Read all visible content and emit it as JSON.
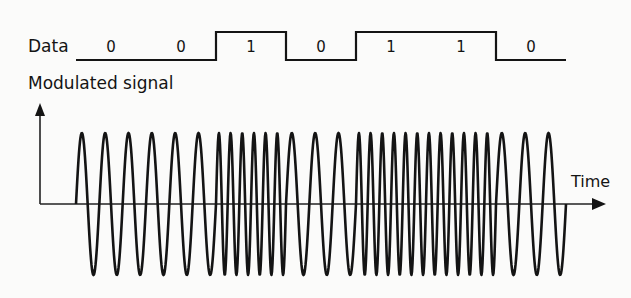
{
  "labels": {
    "data": "Data",
    "signal": "Modulated signal",
    "time": "Time"
  },
  "data_bits": [
    "0",
    "0",
    "1",
    "0",
    "1",
    "1",
    "0"
  ],
  "colors": {
    "ink": "#141414",
    "background": "#fbfbfa"
  },
  "chart_data": {
    "type": "line",
    "xlabel": "Time",
    "ylabel": "Modulated signal",
    "series": [
      {
        "name": "Data",
        "kind": "square",
        "bits": [
          0,
          0,
          1,
          0,
          1,
          1,
          0
        ]
      },
      {
        "name": "Modulated signal",
        "kind": "sine",
        "cycles_per_bit": {
          "0": 3,
          "1": 6
        },
        "amplitude": 1
      }
    ],
    "legend": "none",
    "grid": false
  },
  "layout": {
    "bit_start_x": 76,
    "bit_width": 70,
    "data_low_y": 60,
    "data_high_y": 32,
    "axis_x": 40,
    "axis_y": 204,
    "axis_top_y": 103,
    "axis_end_x": 606,
    "wave_amplitude": 71
  }
}
